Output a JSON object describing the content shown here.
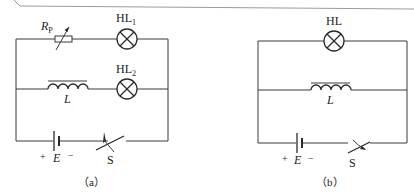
{
  "diagram_a": {
    "caption": "（a）",
    "rheostat_label": "R",
    "rheostat_sub": "P",
    "lamp1_label": "HL",
    "lamp1_sub": "1",
    "lamp2_label": "HL",
    "lamp2_sub": "2",
    "inductor_label": "L",
    "battery_plus": "+",
    "battery_label": "E",
    "battery_minus": "−",
    "switch_label": "S"
  },
  "diagram_b": {
    "caption": "（b）",
    "lamp_label": "HL",
    "inductor_label": "L",
    "battery_plus": "+",
    "battery_label": "E",
    "battery_minus": "−",
    "switch_label": "S"
  },
  "colors": {
    "wire": "#3a3a3a",
    "background": "#ffffff",
    "frame": "#9a9a9a"
  }
}
